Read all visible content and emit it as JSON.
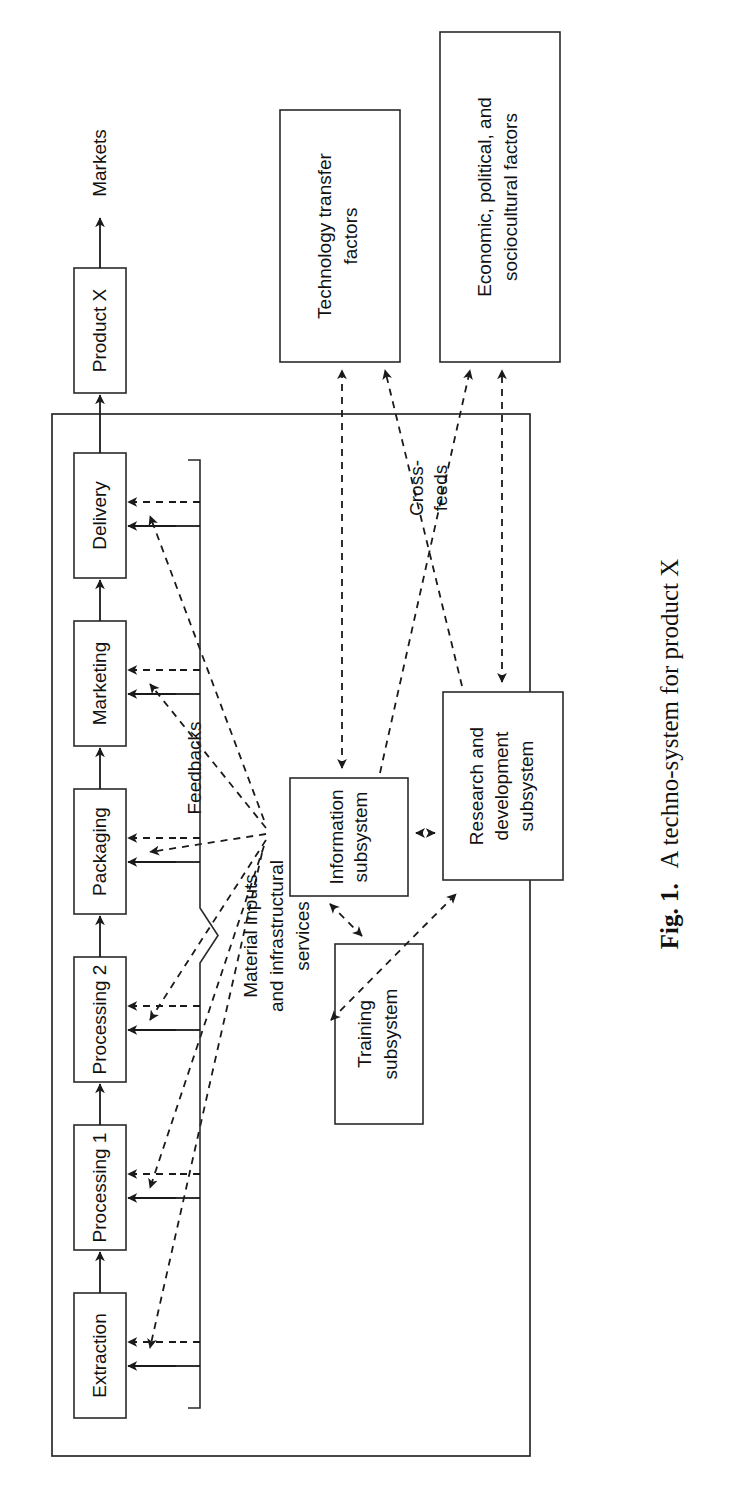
{
  "figure": {
    "caption_prefix": "Fig. 1.",
    "caption_text": "A techno-system for product X"
  },
  "system_boundary": {
    "name": "techno-system boundary"
  },
  "process_chain": {
    "steps": [
      {
        "label": "Extraction"
      },
      {
        "label": "Processing 1"
      },
      {
        "label": "Processing 2"
      },
      {
        "label": "Packaging"
      },
      {
        "label": "Marketing"
      },
      {
        "label": "Delivery"
      }
    ],
    "output_box": {
      "label": "Product X"
    },
    "destination": {
      "label": "Markets"
    }
  },
  "subsystems": [
    {
      "id": "training",
      "lines": [
        "Training",
        "subsystem"
      ]
    },
    {
      "id": "research",
      "lines": [
        "Research and",
        "development",
        "subsystem"
      ]
    },
    {
      "id": "information",
      "lines": [
        "Information",
        "subsystem"
      ]
    }
  ],
  "external_boxes": [
    {
      "id": "economic",
      "lines": [
        "Economic, political, and",
        "sociocultural factors"
      ]
    },
    {
      "id": "technology",
      "lines": [
        "Technology transfer",
        "factors"
      ]
    }
  ],
  "annotations": {
    "feedbacks": "Feedbacks",
    "crossfeeds_line1": "Cross-",
    "crossfeeds_line2": "feeds",
    "inputs_line1": "Material inputs",
    "inputs_line2": "and infrastructural",
    "inputs_line3": "services"
  },
  "colors": {
    "ink": "#1a1a1a",
    "stroke": "#2a2a2a",
    "paper": "#ffffff"
  },
  "chart_data": {
    "type": "diagram",
    "title": "A techno-system for product X",
    "nodes": [
      "Extraction",
      "Processing 1",
      "Processing 2",
      "Packaging",
      "Marketing",
      "Delivery",
      "Product X",
      "Markets",
      "Training subsystem",
      "Research and development subsystem",
      "Information subsystem",
      "Economic, political, and sociocultural factors",
      "Technology transfer factors"
    ],
    "edges": [
      {
        "from": "Extraction",
        "to": "Processing 1",
        "style": "solid"
      },
      {
        "from": "Processing 1",
        "to": "Processing 2",
        "style": "solid"
      },
      {
        "from": "Processing 2",
        "to": "Packaging",
        "style": "solid"
      },
      {
        "from": "Packaging",
        "to": "Marketing",
        "style": "solid"
      },
      {
        "from": "Marketing",
        "to": "Delivery",
        "style": "solid"
      },
      {
        "from": "Delivery",
        "to": "Product X",
        "style": "solid"
      },
      {
        "from": "Product X",
        "to": "Markets",
        "style": "solid"
      },
      {
        "from": "Information subsystem",
        "to": "Extraction",
        "style": "dashed",
        "label": "Feedbacks"
      },
      {
        "from": "Information subsystem",
        "to": "Processing 1",
        "style": "dashed"
      },
      {
        "from": "Information subsystem",
        "to": "Processing 2",
        "style": "dashed"
      },
      {
        "from": "Information subsystem",
        "to": "Packaging",
        "style": "dashed"
      },
      {
        "from": "Information subsystem",
        "to": "Marketing",
        "style": "dashed"
      },
      {
        "from": "Information subsystem",
        "to": "Delivery",
        "style": "dashed"
      },
      {
        "from": "Information subsystem",
        "to": "Research and development subsystem",
        "style": "dashed",
        "bidirectional": true
      },
      {
        "from": "Information subsystem",
        "to": "Training subsystem",
        "style": "dashed",
        "bidirectional": true
      },
      {
        "from": "Training subsystem",
        "to": "Research and development subsystem",
        "style": "dashed",
        "bidirectional": true
      },
      {
        "from": "Research and development subsystem",
        "to": "Economic, political, and sociocultural factors",
        "style": "dashed",
        "bidirectional": true
      },
      {
        "from": "Information subsystem",
        "to": "Technology transfer factors",
        "style": "dashed",
        "bidirectional": true
      },
      {
        "from": "Information subsystem",
        "to": "Economic, political, and sociocultural factors",
        "style": "dashed",
        "label": "Cross-feeds"
      },
      {
        "from": "Research and development subsystem",
        "to": "Technology transfer factors",
        "style": "dashed",
        "label": "Cross-feeds"
      }
    ],
    "inputs": {
      "label": "Material inputs and infrastructural services",
      "targets": [
        "Extraction",
        "Processing 1",
        "Processing 2",
        "Packaging",
        "Marketing",
        "Delivery"
      ]
    }
  }
}
